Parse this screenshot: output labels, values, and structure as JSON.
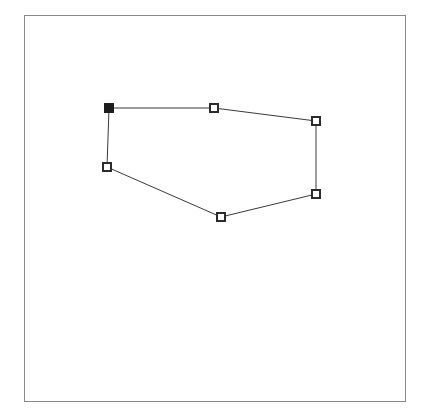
{
  "canvas": {
    "name": "polygon-drawing-canvas",
    "frame": {
      "x": 24,
      "y": 15,
      "width": 382,
      "height": 387
    },
    "background_color": "#ffffff",
    "border_color": "#8a8a8a"
  },
  "shape": {
    "type": "closed-polygon",
    "label": "polygon",
    "stroke_color": "#3a3a3a",
    "stroke_width": 1,
    "fill": "none",
    "closed": true,
    "vertex_count": 6,
    "vertex_marker": {
      "shape": "square",
      "size": 8,
      "open_fill": "#ffffff",
      "selected_fill": "#1c1c1c",
      "stroke_color": "#2b2b2b"
    },
    "vertices": [
      {
        "id": "v1",
        "name": "vertex-top-left",
        "x": 109,
        "y": 108,
        "state": "selected"
      },
      {
        "id": "v2",
        "name": "vertex-top-mid",
        "x": 214,
        "y": 108,
        "state": "open"
      },
      {
        "id": "v3",
        "name": "vertex-top-right",
        "x": 316,
        "y": 121,
        "state": "open"
      },
      {
        "id": "v4",
        "name": "vertex-bottom-right",
        "x": 316,
        "y": 194,
        "state": "open"
      },
      {
        "id": "v5",
        "name": "vertex-bottom-mid",
        "x": 221,
        "y": 217,
        "state": "open"
      },
      {
        "id": "v6",
        "name": "vertex-left",
        "x": 107,
        "y": 167,
        "state": "open"
      }
    ],
    "path": "M 109,108 L 214,108 L 316,121 L 316,194 L 221,217 L 107,167 Z"
  }
}
